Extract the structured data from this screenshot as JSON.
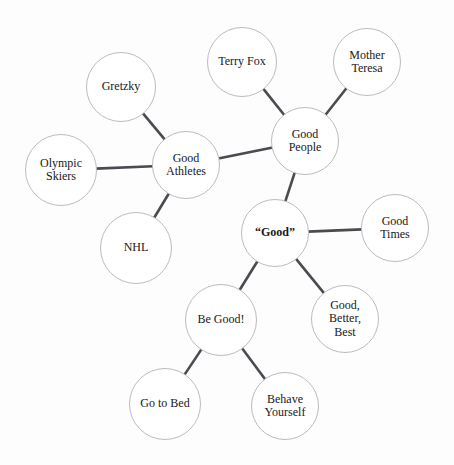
{
  "diagram": {
    "type": "mind-map",
    "background_color": "#fdfdfd",
    "node_fill_color": "#ffffff",
    "node_stroke_color": "#bcbcc0",
    "edge_color": "#4a4a50",
    "text_color": "#18181b",
    "center_node_id": "good"
  },
  "nodes": [
    {
      "id": "good",
      "label": "“Good”",
      "cx": 275,
      "cy": 233,
      "r": 34,
      "font_size": 12,
      "bold": true
    },
    {
      "id": "good-athletes",
      "label": "Good\nAthletes",
      "cx": 186,
      "cy": 165,
      "r": 34,
      "font_size": 12,
      "bold": false
    },
    {
      "id": "good-people",
      "label": "Good\nPeople",
      "cx": 305,
      "cy": 141,
      "r": 34,
      "font_size": 12,
      "bold": false
    },
    {
      "id": "good-times",
      "label": "Good\nTimes",
      "cx": 395,
      "cy": 228,
      "r": 34,
      "font_size": 12,
      "bold": false
    },
    {
      "id": "good-better-best",
      "label": "Good,\nBetter,\nBest",
      "cx": 345,
      "cy": 319,
      "r": 34,
      "font_size": 12,
      "bold": false
    },
    {
      "id": "be-good",
      "label": "Be Good!",
      "cx": 221,
      "cy": 320,
      "r": 36,
      "font_size": 12,
      "bold": false
    },
    {
      "id": "gretzky",
      "label": "Gretzky",
      "cx": 121,
      "cy": 87,
      "r": 35,
      "font_size": 12,
      "bold": false
    },
    {
      "id": "olympic-skiers",
      "label": "Olympic\nSkiers",
      "cx": 61,
      "cy": 170,
      "r": 36,
      "font_size": 12,
      "bold": false
    },
    {
      "id": "nhl",
      "label": "NHL",
      "cx": 136,
      "cy": 248,
      "r": 36,
      "font_size": 12,
      "bold": false
    },
    {
      "id": "terry-fox",
      "label": "Terry Fox",
      "cx": 242,
      "cy": 62,
      "r": 35,
      "font_size": 12,
      "bold": false
    },
    {
      "id": "mother-teresa",
      "label": "Mother\nTeresa",
      "cx": 367,
      "cy": 62,
      "r": 34,
      "font_size": 12,
      "bold": false
    },
    {
      "id": "go-to-bed",
      "label": "Go to Bed",
      "cx": 165,
      "cy": 404,
      "r": 36,
      "font_size": 12,
      "bold": false
    },
    {
      "id": "behave-yourself",
      "label": "Behave\nYourself",
      "cx": 285,
      "cy": 406,
      "r": 34,
      "font_size": 12,
      "bold": false
    }
  ],
  "edges": [
    {
      "from": "good",
      "to": "good-people"
    },
    {
      "from": "good",
      "to": "good-times"
    },
    {
      "from": "good",
      "to": "good-better-best"
    },
    {
      "from": "good",
      "to": "be-good"
    },
    {
      "from": "good-people",
      "to": "good-athletes"
    },
    {
      "from": "good-people",
      "to": "terry-fox"
    },
    {
      "from": "good-people",
      "to": "mother-teresa"
    },
    {
      "from": "good-athletes",
      "to": "gretzky"
    },
    {
      "from": "good-athletes",
      "to": "olympic-skiers"
    },
    {
      "from": "good-athletes",
      "to": "nhl"
    },
    {
      "from": "be-good",
      "to": "go-to-bed"
    },
    {
      "from": "be-good",
      "to": "behave-yourself"
    }
  ],
  "edge_style": {
    "width": 2.6,
    "cap": "butt"
  }
}
